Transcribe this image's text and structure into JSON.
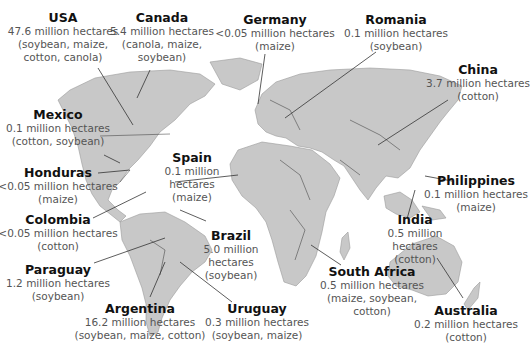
{
  "map": {
    "type": "world-choropleth-annotated",
    "land_color": "#c8c8c8",
    "leader_color": "#333333",
    "countries": [
      {
        "name": "USA",
        "area": "47.6 million hectares",
        "crops": [
          "(soybean, maize,",
          "cotton, canola)"
        ]
      },
      {
        "name": "Canada",
        "area": "5.4 million hectares",
        "crops": [
          "(canola, maize,",
          "soybean)"
        ]
      },
      {
        "name": "Germany",
        "area": "<0.05 million hectares",
        "crops": [
          "(maize)"
        ]
      },
      {
        "name": "Romania",
        "area": "0.1 million hectares",
        "crops": [
          "(soybean)"
        ]
      },
      {
        "name": "China",
        "area": "3.7 million hectares",
        "crops": [
          "(cotton)"
        ]
      },
      {
        "name": "Mexico",
        "area": "0.1 million hectares",
        "crops": [
          "(cotton, soybean)"
        ]
      },
      {
        "name": "Spain",
        "area": "0.1 million",
        "area2": "hectares",
        "crops": [
          "(maize)"
        ]
      },
      {
        "name": "Honduras",
        "area": "<0.05 million hectares",
        "crops": [
          "(maize)"
        ]
      },
      {
        "name": "Philippines",
        "area": "0.1 million hectares",
        "crops": [
          "(maize)"
        ]
      },
      {
        "name": "India",
        "area": "0.5 million",
        "area2": "hectares",
        "crops": [
          "(cotton)"
        ]
      },
      {
        "name": "Colombia",
        "area": "<0.05 million hectares",
        "crops": [
          "(cotton)"
        ]
      },
      {
        "name": "Brazil",
        "area": "5.0 million",
        "area2": "hectares",
        "crops": [
          "(soybean)"
        ]
      },
      {
        "name": "Paraguay",
        "area": "1.2 million hectares",
        "crops": [
          "(soybean)"
        ]
      },
      {
        "name": "South Africa",
        "area": "0.5 million hectares",
        "crops": [
          "(maize, soybean,",
          "cotton)"
        ]
      },
      {
        "name": "Argentina",
        "area": "16.2 million hectares",
        "crops": [
          "(soybean, maize, cotton)"
        ]
      },
      {
        "name": "Uruguay",
        "area": "0.3 million hectares",
        "crops": [
          "(soybean, maize)"
        ]
      },
      {
        "name": "Australia",
        "area": "0.2 million hectares",
        "crops": [
          "(cotton)"
        ]
      }
    ]
  }
}
